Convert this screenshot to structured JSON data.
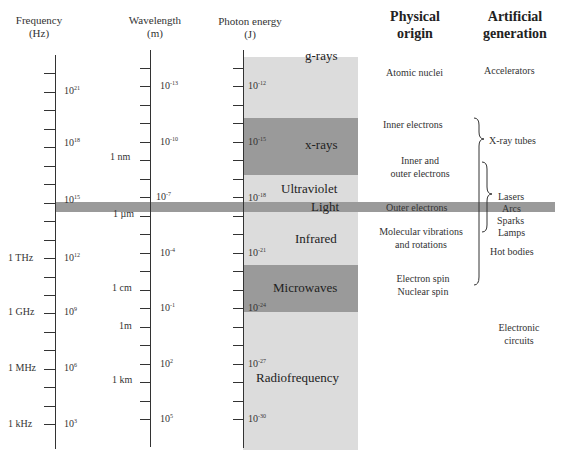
{
  "headers": {
    "frequency": {
      "line1": "Frequency",
      "line2": "(Hz)"
    },
    "wavelength": {
      "line1": "Wavelength",
      "line2": "(m)"
    },
    "photon_energy": {
      "line1": "Photon energy",
      "line2": "(J)"
    },
    "physical_origin": {
      "line1": "Physical",
      "line2": "origin"
    },
    "artificial_generation": {
      "line1": "Artificial",
      "line2": "generation"
    }
  },
  "frequency_axis": {
    "powers": [
      {
        "base": "10",
        "exp": "21"
      },
      {
        "base": "10",
        "exp": "18"
      },
      {
        "base": "10",
        "exp": "15"
      },
      {
        "base": "10",
        "exp": "12"
      },
      {
        "base": "10",
        "exp": "9"
      },
      {
        "base": "10",
        "exp": "6"
      },
      {
        "base": "10",
        "exp": "3"
      }
    ],
    "named": [
      "1 THz",
      "1 GHz",
      "1 MHz",
      "1 kHz"
    ]
  },
  "wavelength_axis": {
    "powers": [
      {
        "base": "10",
        "exp": "-13"
      },
      {
        "base": "10",
        "exp": "-10"
      },
      {
        "base": "10",
        "exp": "-7"
      },
      {
        "base": "10",
        "exp": "-4"
      },
      {
        "base": "10",
        "exp": "-1"
      },
      {
        "base": "10",
        "exp": "2"
      },
      {
        "base": "10",
        "exp": "5"
      }
    ],
    "named": [
      "1 nm",
      "1 µm",
      "1 cm",
      "1m",
      "1 km"
    ]
  },
  "energy_axis": {
    "powers": [
      {
        "base": "10",
        "exp": "-12"
      },
      {
        "base": "10",
        "exp": "-15"
      },
      {
        "base": "10",
        "exp": "-18"
      },
      {
        "base": "10",
        "exp": "-21"
      },
      {
        "base": "10",
        "exp": "-24"
      },
      {
        "base": "10",
        "exp": "-27"
      },
      {
        "base": "10",
        "exp": "-30"
      }
    ]
  },
  "bands": [
    {
      "name": "g-rays",
      "color": "#dcdcdc"
    },
    {
      "name": "x-rays",
      "color": "#9a9a9a"
    },
    {
      "name": "Ultraviolet",
      "color": "#dcdcdc"
    },
    {
      "name": "Light",
      "color": "#9a9a9a"
    },
    {
      "name": "Infrared",
      "color": "#dcdcdc"
    },
    {
      "name": "Microwaves",
      "color": "#9a9a9a"
    },
    {
      "name": "Radiofrequency",
      "color": "#dcdcdc"
    }
  ],
  "physical_origin": {
    "atomic_nuclei": "Atomic nuclei",
    "inner_electrons": "Inner electrons",
    "inner_outer_1": "Inner and",
    "inner_outer_2": "outer electrons",
    "outer_electrons": "Outer electrons",
    "molecular_1": "Molecular vibrations",
    "molecular_2": "and rotations",
    "electron_spin": "Electron spin",
    "nuclear_spin": "Nuclear spin"
  },
  "artificial_generation": {
    "accelerators": "Accelerators",
    "xray_tubes": "X-ray tubes",
    "lasers": "Lasers",
    "arcs": "Arcs",
    "sparks": "Sparks",
    "lamps": "Lamps",
    "hot_bodies": "Hot bodies",
    "electronic_1": "Electronic",
    "electronic_2": "circuits"
  }
}
